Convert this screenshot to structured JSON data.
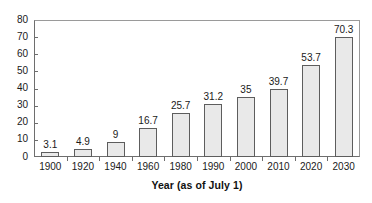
{
  "chart_data": {
    "type": "bar",
    "title": "",
    "subtitle": "",
    "xlabel": "Year (as of July 1)",
    "ylabel": "",
    "categories": [
      "1900",
      "1920",
      "1940",
      "1960",
      "1980",
      "1990",
      "2000",
      "2010",
      "2020",
      "2030"
    ],
    "values": [
      3.1,
      4.9,
      9,
      16.7,
      25.7,
      31.2,
      35,
      39.7,
      53.7,
      70.3
    ],
    "value_labels": [
      "3.1",
      "4.9",
      "9",
      "16.7",
      "25.7",
      "31.2",
      "35",
      "39.7",
      "53.7",
      "70.3"
    ],
    "ylim": [
      0,
      80
    ],
    "ytick_labels": [
      "0",
      "10",
      "20",
      "30",
      "40",
      "50",
      "60",
      "70",
      "80"
    ],
    "ytick_values": [
      0,
      10,
      20,
      30,
      40,
      50,
      60,
      70,
      80
    ],
    "grid": false,
    "legend": null,
    "legend_position": "none",
    "bar_fill_color": "#e9e9e9",
    "bar_border_color": "#5d5d5d",
    "axis_color": "#6e6e6e",
    "text_color": "#1a1a1a",
    "background_color": "#ffffff",
    "data_labels_shown": true
  }
}
